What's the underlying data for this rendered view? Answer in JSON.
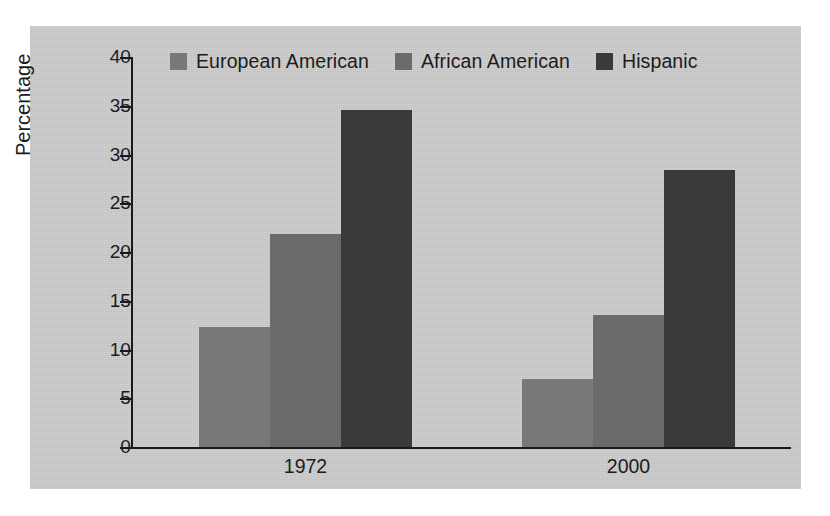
{
  "chart_data": {
    "type": "bar",
    "title": "",
    "xlabel": "",
    "ylabel": "Percentage",
    "categories": [
      "1972",
      "2000"
    ],
    "series": [
      {
        "name": "European American",
        "values": [
          12.3,
          7.0
        ],
        "color": "#787878"
      },
      {
        "name": "African American",
        "values": [
          21.8,
          13.5
        ],
        "color": "#6b6b6b"
      },
      {
        "name": "Hispanic",
        "values": [
          34.6,
          28.4
        ],
        "color": "#3a3a3a"
      }
    ],
    "ylim": [
      0,
      40
    ],
    "yticks": [
      0,
      5,
      10,
      15,
      20,
      25,
      30,
      35,
      40
    ],
    "ytick_labels": [
      "0",
      "5",
      "10",
      "15",
      "20",
      "25",
      "30",
      "35",
      "40"
    ],
    "grid": false,
    "legend_position": "top",
    "grouped": true,
    "bar_gap_within_group": 0
  },
  "colors": {
    "panel_background": "#cdcdcd",
    "page_background": "#ffffff",
    "axis": "#1a1a1a",
    "text": "#1c1c1c"
  }
}
